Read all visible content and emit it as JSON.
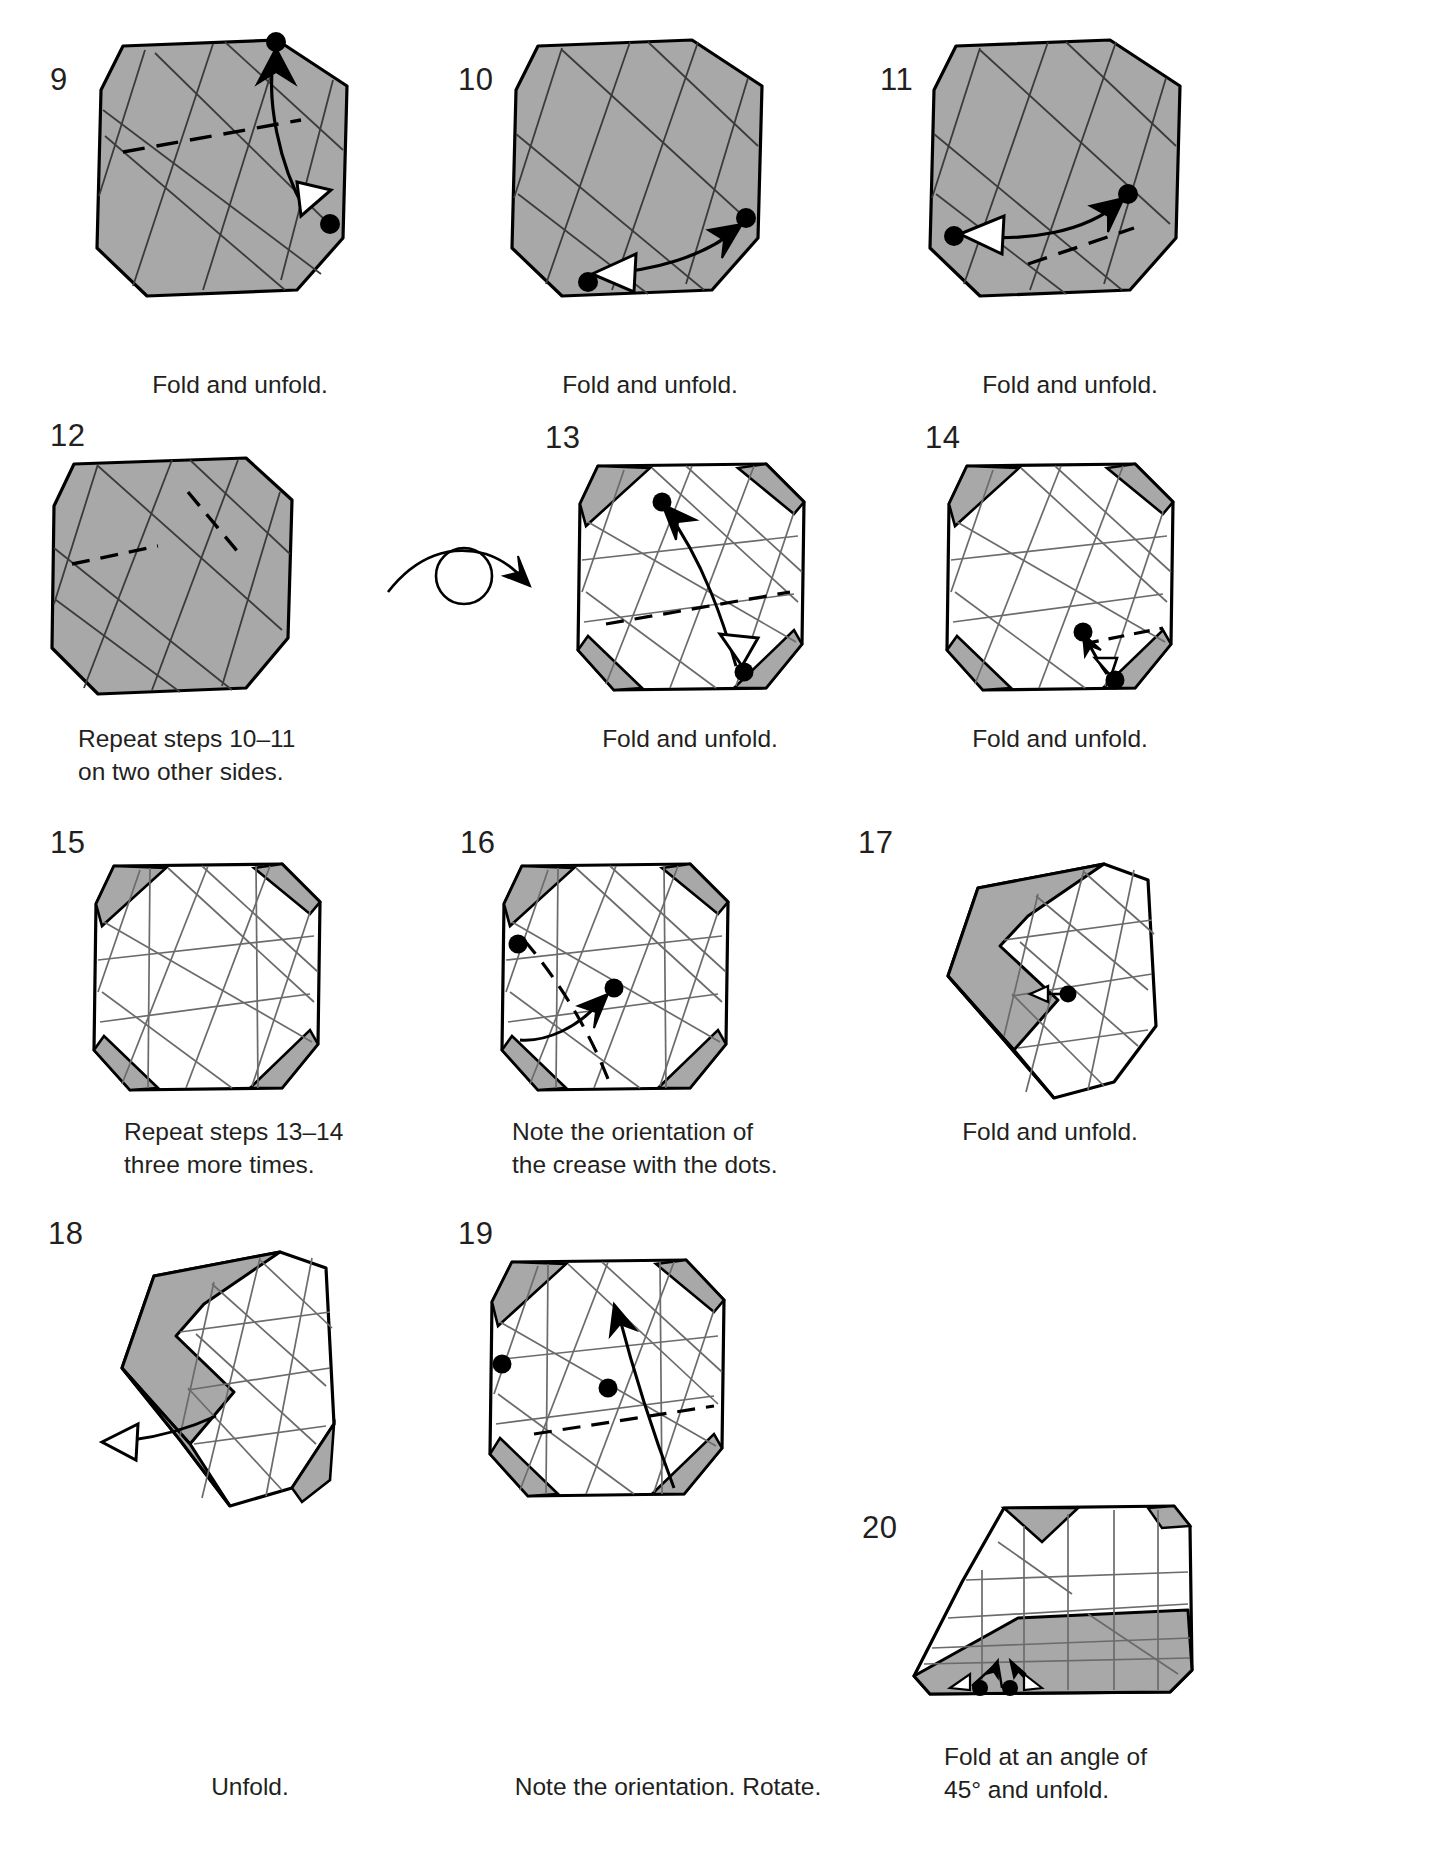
{
  "document": {
    "type": "origami-folding-instructions",
    "page_range": "steps 9 through 20",
    "colors": {
      "paper_front": "#a8a8a8",
      "paper_back": "#ffffff",
      "outline": "#000000",
      "crease": "#6b6b6b",
      "text": "#231f20"
    }
  },
  "steps": [
    {
      "number": "9",
      "caption": "Fold and unfold.",
      "shape": "shaded-octagon",
      "dots": 2,
      "arrow": "fold-and-unfold-hollow-arrowhead"
    },
    {
      "number": "10",
      "caption": "Fold and unfold.",
      "shape": "shaded-octagon",
      "dots": 2,
      "arrow": "fold-and-unfold-hollow-arrowhead"
    },
    {
      "number": "11",
      "caption": "Fold and unfold.",
      "shape": "shaded-octagon",
      "dots": 2,
      "arrow": "fold-and-unfold-hollow-arrowhead"
    },
    {
      "number": "12",
      "caption": "Repeat steps 10–11\non two other sides.",
      "shape": "shaded-octagon",
      "dots": 0,
      "arrow": "none",
      "symbol": "turn-over-loop-arrow"
    },
    {
      "number": "13",
      "caption": "Fold and unfold.",
      "shape": "white-octagon-with-grey-corners",
      "dots": 2,
      "arrow": "fold-and-unfold-hollow-arrowhead"
    },
    {
      "number": "14",
      "caption": "Fold and unfold.",
      "shape": "white-octagon-with-grey-corners",
      "dots": 2,
      "arrow": "fold-and-unfold-hollow-arrowhead"
    },
    {
      "number": "15",
      "caption": "Repeat steps 13–14\nthree more times.",
      "shape": "white-octagon-with-grey-corners",
      "dots": 0,
      "arrow": "none"
    },
    {
      "number": "16",
      "caption": "Note the orientation of\nthe crease with the dots.",
      "shape": "white-octagon-with-grey-corners",
      "dots": 2,
      "arrow": "curved-fold-arrow"
    },
    {
      "number": "17",
      "caption": "Fold and unfold.",
      "shape": "folded-flap-left",
      "dots": 1,
      "arrow": "short-double-arrow"
    },
    {
      "number": "18",
      "caption": "Unfold.",
      "shape": "folded-flap-left",
      "dots": 0,
      "arrow": "unfold-hollow-arrow-left"
    },
    {
      "number": "19",
      "caption": "Note the orientation. Rotate.",
      "shape": "white-octagon-with-grey-corners",
      "dots": 2,
      "arrow": "curved-fold-arrow"
    },
    {
      "number": "20",
      "caption": "Fold at an angle of\n45° and unfold.",
      "shape": "angled-flat-fold",
      "dots": 2,
      "arrow": "two-small-angled-arrows"
    }
  ],
  "turn_over_symbol": {
    "name": "turn-over-loop-arrow",
    "description": "loop with arrowhead indicating turn paper over"
  }
}
